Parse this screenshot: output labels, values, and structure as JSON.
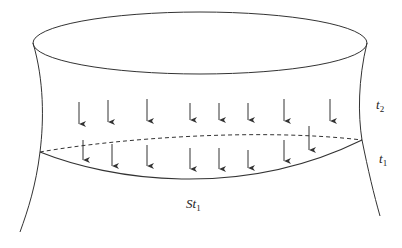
{
  "diagram": {
    "labels": {
      "t2": {
        "base": "t",
        "sub": "2"
      },
      "t1": {
        "base": "t",
        "sub": "1"
      },
      "surface": {
        "base": "St",
        "sub": "1"
      }
    },
    "colors": {
      "stroke": "#333333",
      "background": "#ffffff"
    },
    "upper_arrows_x": [
      79,
      108,
      147,
      190,
      219,
      248,
      284,
      330
    ],
    "lower_arrows_x": [
      83,
      112,
      147,
      190,
      219,
      248,
      284,
      309
    ]
  }
}
